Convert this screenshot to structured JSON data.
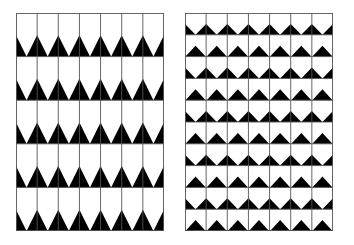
{
  "figure": {
    "background": "#ffffff",
    "ink": "#000000",
    "grid_line": "#555555",
    "panels": [
      {
        "id": "left",
        "x": 16,
        "y": 13,
        "width": 148,
        "height": 218,
        "columns": 7,
        "rows": 5,
        "row_patterns": [
          "edge",
          "edge",
          "edge",
          "edge",
          "edge"
        ],
        "triangle_height_ratio": 0.49
      },
      {
        "id": "right",
        "x": 185,
        "y": 13,
        "width": 148,
        "height": 218,
        "columns": 7,
        "rows": 10,
        "row_patterns": [
          "edge",
          "center",
          "edge",
          "center",
          "edge",
          "center",
          "edge",
          "center",
          "edge",
          "center"
        ],
        "triangle_height_ratio": 0.5
      }
    ]
  }
}
